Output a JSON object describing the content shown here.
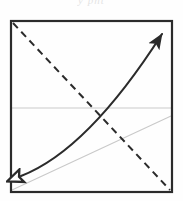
{
  "figure": {
    "title_fragment": "y pnt",
    "background_color": "#fefefe",
    "frame": {
      "label": "square-frame",
      "color": "#2b2b2b",
      "stroke_width": 2.2,
      "x": 11,
      "y": 21,
      "width": 161,
      "height": 171
    },
    "elements": [
      {
        "name": "solid-curve-double-arrow",
        "style": "solid",
        "color": "#2b2b2b",
        "stroke_width": 2.1,
        "arrow_start": "hollow",
        "arrow_end": "filled",
        "description": "concave curve rising from bottom-left to top-right",
        "path": "M 19 178 Q 88 152 164 32"
      },
      {
        "name": "dashed-diagonal",
        "style": "dashed",
        "color": "#2b2b2b",
        "stroke_width": 2.0,
        "dash_pattern": "7 5",
        "description": "dashed line from top-left corner to bottom-right corner",
        "x1": 13,
        "y1": 23,
        "x2": 170,
        "y2": 190
      },
      {
        "name": "gray-horizontal-line",
        "style": "solid",
        "color": "#c9c9c9",
        "stroke_width": 1.1,
        "description": "light gray horizontal reference line",
        "x1": 12,
        "y1": 108,
        "x2": 171,
        "y2": 108
      },
      {
        "name": "gray-diagonal-line",
        "style": "solid",
        "color": "#c9c9c9",
        "stroke_width": 1.1,
        "description": "light gray diagonal from bottom-left corner to right edge",
        "x1": 12,
        "y1": 190,
        "x2": 171,
        "y2": 116
      }
    ]
  }
}
